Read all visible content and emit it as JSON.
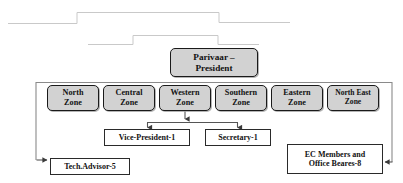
{
  "diagram": {
    "type": "organizational-chart",
    "title_node": {
      "id": "president",
      "label": "Parivaar –\nPresident"
    },
    "zones": [
      {
        "id": "north",
        "label": "North\nZone"
      },
      {
        "id": "central",
        "label": "Central\nZone"
      },
      {
        "id": "western",
        "label": "Western\nZone"
      },
      {
        "id": "southern",
        "label": "Southern\nZone"
      },
      {
        "id": "eastern",
        "label": "Eastern\nZone"
      },
      {
        "id": "north-east",
        "label": "North East\nZone"
      }
    ],
    "roles": {
      "vice_president": "Vice-President-1",
      "secretary": "Secretary-1",
      "tech_advisor": "Tech.Advisor-5",
      "ec_members": "EC Members and\nOffice Beares-8"
    },
    "colors": {
      "zone_fill": "#d2d2d2",
      "node_stroke": "#1a1a1a",
      "plain_fill": "#ffffff",
      "connector": "#555555",
      "artifact_line": "#c9c9c9"
    }
  }
}
